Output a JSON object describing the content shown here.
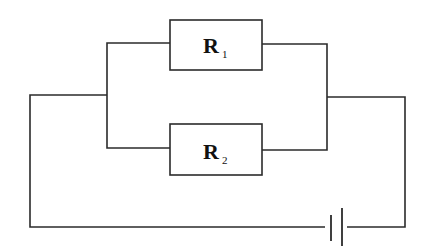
{
  "diagram": {
    "type": "circuit",
    "components": [
      {
        "id": "R1",
        "kind": "resistor",
        "label": "R",
        "subscript": "1"
      },
      {
        "id": "R2",
        "kind": "resistor",
        "label": "R",
        "subscript": "2"
      },
      {
        "id": "battery",
        "kind": "cell"
      }
    ],
    "colors": {
      "line": "#2b2b2b",
      "background": "#ffffff"
    }
  }
}
